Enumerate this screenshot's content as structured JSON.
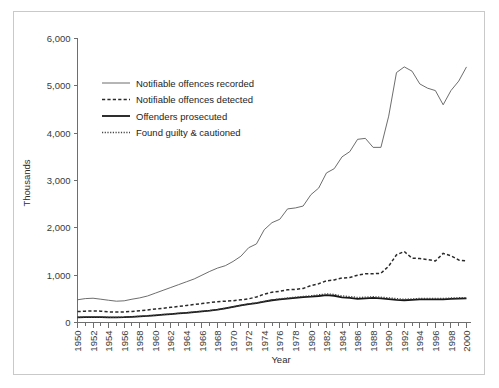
{
  "chart_data": {
    "type": "line",
    "title": "",
    "xlabel": "Year",
    "ylabel": "Thousands",
    "xlim": [
      1950,
      2000
    ],
    "ylim": [
      0,
      6000
    ],
    "yticks": [
      0,
      1000,
      2000,
      3000,
      4000,
      5000,
      6000
    ],
    "ytick_labels": [
      "0",
      "1,000",
      "2,000",
      "3,000",
      "4,000",
      "5,000",
      "6,000"
    ],
    "xticks": [
      1950,
      1952,
      1954,
      1956,
      1958,
      1960,
      1962,
      1964,
      1966,
      1968,
      1970,
      1972,
      1974,
      1976,
      1978,
      1980,
      1982,
      1984,
      1986,
      1988,
      1990,
      1992,
      1994,
      1996,
      1998,
      2000
    ],
    "xtick_labels": [
      "1950",
      "1952",
      "1954",
      "1956",
      "1958",
      "1960",
      "1962",
      "1964",
      "1966",
      "1968",
      "1970",
      "1972",
      "1974",
      "1976",
      "1978",
      "1980",
      "1982",
      "1984",
      "1986",
      "1988",
      "1990",
      "1992",
      "1994",
      "1996",
      "1998",
      "2000"
    ],
    "minor_xticks_every": 1,
    "grid": false,
    "legend_position": "upper-left-inside",
    "x": [
      1950,
      1951,
      1952,
      1953,
      1954,
      1955,
      1956,
      1957,
      1958,
      1959,
      1960,
      1961,
      1962,
      1963,
      1964,
      1965,
      1966,
      1967,
      1968,
      1969,
      1970,
      1971,
      1972,
      1973,
      1974,
      1975,
      1976,
      1977,
      1978,
      1979,
      1980,
      1981,
      1982,
      1983,
      1984,
      1985,
      1986,
      1987,
      1988,
      1989,
      1990,
      1991,
      1992,
      1993,
      1994,
      1995,
      1996,
      1997,
      1998,
      1999,
      2000
    ],
    "series": [
      {
        "name": "Notifiable offences recorded",
        "style": "solid-thin",
        "color": "#5c5c5c",
        "values": [
          480,
          505,
          513,
          492,
          470,
          450,
          458,
          492,
          520,
          560,
          620,
          680,
          740,
          800,
          860,
          920,
          1000,
          1080,
          1150,
          1200,
          1290,
          1400,
          1580,
          1660,
          1960,
          2110,
          2180,
          2400,
          2420,
          2460,
          2700,
          2840,
          3160,
          3250,
          3500,
          3610,
          3870,
          3890,
          3700,
          3700,
          4360,
          5280,
          5400,
          5310,
          5040,
          4950,
          4900,
          4600,
          4900,
          5100,
          5400
        ]
      },
      {
        "name": "Notifiable offences detected",
        "style": "dashed",
        "color": "#2a2a2a",
        "values": [
          230,
          240,
          245,
          240,
          225,
          220,
          222,
          235,
          250,
          265,
          285,
          300,
          320,
          340,
          360,
          380,
          400,
          420,
          440,
          450,
          460,
          480,
          500,
          540,
          600,
          640,
          660,
          690,
          700,
          720,
          780,
          820,
          880,
          900,
          940,
          950,
          1000,
          1030,
          1030,
          1040,
          1190,
          1430,
          1500,
          1360,
          1350,
          1330,
          1300,
          1460,
          1410,
          1320,
          1300
        ]
      },
      {
        "name": "Offenders prosecuted",
        "style": "solid-thick",
        "color": "#171717",
        "values": [
          110,
          112,
          115,
          112,
          108,
          108,
          112,
          120,
          128,
          138,
          152,
          165,
          178,
          192,
          205,
          220,
          235,
          250,
          270,
          300,
          330,
          360,
          390,
          410,
          440,
          470,
          490,
          505,
          520,
          535,
          545,
          560,
          580,
          565,
          530,
          520,
          500,
          510,
          520,
          510,
          495,
          480,
          470,
          480,
          490,
          490,
          490,
          490,
          500,
          505,
          510
        ]
      },
      {
        "name": "Found guilty & cautioned",
        "style": "dotted",
        "color": "#444444",
        "values": [
          112,
          114,
          117,
          114,
          110,
          110,
          114,
          122,
          130,
          140,
          154,
          167,
          180,
          194,
          207,
          222,
          237,
          252,
          272,
          302,
          333,
          364,
          394,
          415,
          446,
          478,
          500,
          518,
          535,
          552,
          565,
          585,
          605,
          595,
          562,
          548,
          530,
          535,
          545,
          535,
          520,
          505,
          492,
          500,
          508,
          508,
          508,
          508,
          518,
          523,
          528
        ]
      }
    ]
  },
  "legend": {
    "entries": [
      {
        "label": "Notifiable offences recorded"
      },
      {
        "label": "Notifiable offences detected"
      },
      {
        "label": "Offenders prosecuted"
      },
      {
        "label": "Found guilty & cautioned"
      }
    ]
  }
}
